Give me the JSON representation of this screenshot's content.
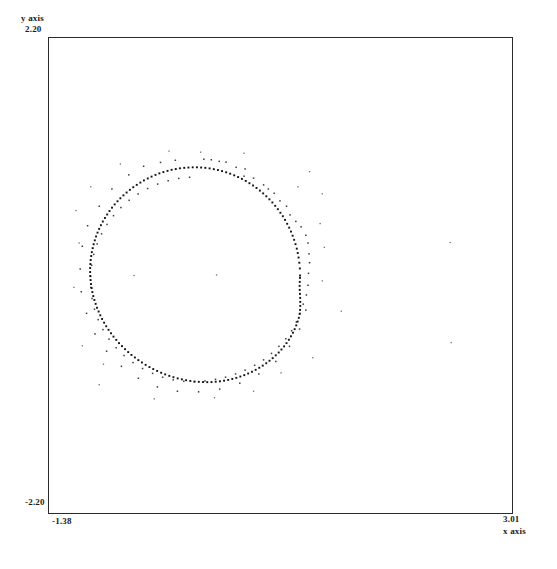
{
  "axes": {
    "y_title": "y axis",
    "y_max_label": "2.20",
    "y_min_label": "-2.20",
    "x_title": "x axis",
    "x_min_label": "-1.38",
    "x_max_label": "3.01"
  },
  "style": {
    "frame_color": "#2b2b2b",
    "point_color": "#111111",
    "background": "#ffffff"
  },
  "chart_data": {
    "type": "scatter",
    "title": "",
    "xlabel": "x axis",
    "ylabel": "y axis",
    "xlim": [
      -1.38,
      3.01
    ],
    "ylim": [
      -2.2,
      2.2
    ],
    "grid": false,
    "legend": null,
    "series": [
      {
        "name": "ring",
        "marker": "dot",
        "points": [
          [
            1.0,
            0.0
          ],
          [
            0.998,
            0.065
          ],
          [
            0.993,
            0.118
          ],
          [
            0.986,
            0.166
          ],
          [
            0.978,
            0.208
          ],
          [
            0.969,
            0.248
          ],
          [
            0.957,
            0.29
          ],
          [
            0.944,
            0.33
          ],
          [
            0.93,
            0.368
          ],
          [
            0.914,
            0.406
          ],
          [
            0.897,
            0.442
          ],
          [
            0.878,
            0.478
          ],
          [
            0.858,
            0.514
          ],
          [
            0.837,
            0.548
          ],
          [
            0.814,
            0.58
          ],
          [
            0.79,
            0.613
          ],
          [
            0.765,
            0.644
          ],
          [
            0.738,
            0.675
          ],
          [
            0.71,
            0.704
          ],
          [
            0.681,
            0.732
          ],
          [
            0.651,
            0.759
          ],
          [
            0.62,
            0.785
          ],
          [
            0.588,
            0.809
          ],
          [
            0.555,
            0.832
          ],
          [
            0.521,
            0.853
          ],
          [
            0.486,
            0.874
          ],
          [
            0.45,
            0.893
          ],
          [
            0.414,
            0.91
          ],
          [
            0.377,
            0.926
          ],
          [
            0.339,
            0.941
          ],
          [
            0.301,
            0.954
          ],
          [
            0.262,
            0.965
          ],
          [
            0.223,
            0.975
          ],
          [
            0.184,
            0.983
          ],
          [
            0.144,
            0.99
          ],
          [
            0.104,
            0.995
          ],
          [
            0.064,
            0.998
          ],
          [
            0.024,
            1.0
          ],
          [
            -0.016,
            1.0
          ],
          [
            -0.056,
            0.998
          ],
          [
            -0.096,
            0.995
          ],
          [
            -0.136,
            0.991
          ],
          [
            -0.176,
            0.984
          ],
          [
            -0.215,
            0.977
          ],
          [
            -0.254,
            0.967
          ],
          [
            -0.293,
            0.956
          ],
          [
            -0.331,
            0.944
          ],
          [
            -0.368,
            0.93
          ],
          [
            -0.405,
            0.914
          ],
          [
            -0.441,
            0.897
          ],
          [
            -0.477,
            0.879
          ],
          [
            -0.511,
            0.859
          ],
          [
            -0.545,
            0.838
          ],
          [
            -0.578,
            0.816
          ],
          [
            -0.61,
            0.792
          ],
          [
            -0.641,
            0.767
          ],
          [
            -0.671,
            0.741
          ],
          [
            -0.7,
            0.714
          ],
          [
            -0.727,
            0.686
          ],
          [
            -0.754,
            0.657
          ],
          [
            -0.779,
            0.627
          ],
          [
            -0.803,
            0.596
          ],
          [
            -0.825,
            0.564
          ],
          [
            -0.846,
            0.532
          ],
          [
            -0.866,
            0.499
          ],
          [
            -0.884,
            0.465
          ],
          [
            -0.901,
            0.431
          ],
          [
            -0.916,
            0.396
          ],
          [
            -0.93,
            0.361
          ],
          [
            -0.942,
            0.325
          ],
          [
            -0.953,
            0.289
          ],
          [
            -0.962,
            0.253
          ],
          [
            -0.97,
            0.216
          ],
          [
            -0.976,
            0.18
          ],
          [
            -0.981,
            0.143
          ],
          [
            -0.984,
            0.106
          ],
          [
            -0.986,
            0.069
          ],
          [
            -0.986,
            0.032
          ],
          [
            -0.985,
            -0.005
          ],
          [
            -0.982,
            -0.042
          ],
          [
            -0.978,
            -0.079
          ],
          [
            -0.972,
            -0.116
          ],
          [
            -0.965,
            -0.153
          ],
          [
            -0.956,
            -0.19
          ],
          [
            -0.946,
            -0.226
          ],
          [
            -0.934,
            -0.262
          ],
          [
            -0.921,
            -0.298
          ],
          [
            -0.906,
            -0.333
          ],
          [
            -0.89,
            -0.368
          ],
          [
            -0.873,
            -0.402
          ],
          [
            -0.854,
            -0.436
          ],
          [
            -0.834,
            -0.469
          ],
          [
            -0.812,
            -0.502
          ],
          [
            -0.789,
            -0.534
          ],
          [
            -0.765,
            -0.565
          ],
          [
            -0.739,
            -0.595
          ],
          [
            -0.713,
            -0.625
          ],
          [
            -0.685,
            -0.653
          ],
          [
            -0.656,
            -0.681
          ],
          [
            -0.626,
            -0.708
          ],
          [
            -0.595,
            -0.734
          ],
          [
            -0.563,
            -0.758
          ],
          [
            -0.53,
            -0.782
          ],
          [
            -0.496,
            -0.804
          ],
          [
            -0.461,
            -0.826
          ],
          [
            -0.425,
            -0.846
          ],
          [
            -0.389,
            -0.865
          ],
          [
            -0.352,
            -0.882
          ],
          [
            -0.314,
            -0.899
          ],
          [
            -0.276,
            -0.914
          ],
          [
            -0.237,
            -0.928
          ],
          [
            -0.198,
            -0.94
          ],
          [
            -0.158,
            -0.951
          ],
          [
            -0.118,
            -0.96
          ],
          [
            -0.078,
            -0.968
          ],
          [
            -0.038,
            -0.975
          ],
          [
            0.002,
            -0.98
          ],
          [
            0.042,
            -0.983
          ],
          [
            0.082,
            -0.985
          ],
          [
            0.122,
            -0.986
          ],
          [
            0.162,
            -0.985
          ],
          [
            0.202,
            -0.982
          ],
          [
            0.242,
            -0.978
          ],
          [
            0.281,
            -0.972
          ],
          [
            0.32,
            -0.965
          ],
          [
            0.359,
            -0.956
          ],
          [
            0.397,
            -0.946
          ],
          [
            0.435,
            -0.934
          ],
          [
            0.472,
            -0.921
          ],
          [
            0.509,
            -0.906
          ],
          [
            0.545,
            -0.89
          ],
          [
            0.58,
            -0.872
          ],
          [
            0.614,
            -0.853
          ],
          [
            0.647,
            -0.833
          ],
          [
            0.68,
            -0.811
          ],
          [
            0.711,
            -0.788
          ],
          [
            0.741,
            -0.764
          ],
          [
            0.77,
            -0.738
          ],
          [
            0.798,
            -0.712
          ],
          [
            0.824,
            -0.684
          ],
          [
            0.849,
            -0.655
          ],
          [
            0.872,
            -0.625
          ],
          [
            0.894,
            -0.594
          ],
          [
            0.914,
            -0.562
          ],
          [
            0.933,
            -0.529
          ],
          [
            0.949,
            -0.496
          ],
          [
            0.964,
            -0.461
          ],
          [
            0.977,
            -0.426
          ],
          [
            0.988,
            -0.391
          ],
          [
            0.996,
            -0.355
          ],
          [
            1.0,
            -0.318
          ],
          [
            1.002,
            -0.281
          ],
          [
            1.002,
            -0.244
          ],
          [
            1.001,
            -0.207
          ],
          [
            0.999,
            -0.17
          ],
          [
            0.997,
            -0.133
          ],
          [
            0.996,
            -0.096
          ],
          [
            0.997,
            -0.059
          ],
          [
            0.999,
            -0.022
          ]
        ]
      },
      {
        "name": "noise",
        "marker": "dot",
        "points": [
          [
            0.09,
            1.075
          ],
          [
            0.16,
            1.07
          ],
          [
            0.235,
            1.055
          ],
          [
            0.3,
            1.048
          ],
          [
            0.395,
            1.0
          ],
          [
            0.48,
            0.985
          ],
          [
            0.47,
            0.918
          ],
          [
            0.56,
            0.9
          ],
          [
            0.655,
            0.838
          ],
          [
            0.7,
            0.8
          ],
          [
            0.755,
            0.76
          ],
          [
            0.81,
            0.69
          ],
          [
            0.872,
            0.64
          ],
          [
            0.905,
            0.56
          ],
          [
            0.96,
            0.5
          ],
          [
            1.01,
            0.45
          ],
          [
            1.055,
            0.372
          ],
          [
            1.075,
            0.3
          ],
          [
            1.085,
            0.2
          ],
          [
            1.09,
            0.118
          ],
          [
            1.08,
            0.02
          ],
          [
            1.075,
            -0.09
          ],
          [
            1.06,
            -0.18
          ],
          [
            1.03,
            -0.265
          ],
          [
            1.0,
            -0.35
          ],
          [
            0.965,
            -0.43
          ],
          [
            0.92,
            -0.51
          ],
          [
            0.865,
            -0.585
          ],
          [
            0.8,
            -0.655
          ],
          [
            0.73,
            -0.72
          ],
          [
            0.655,
            -0.78
          ],
          [
            0.57,
            -0.83
          ],
          [
            0.48,
            -0.875
          ],
          [
            0.39,
            -0.91
          ],
          [
            0.295,
            -0.94
          ],
          [
            0.2,
            -0.96
          ],
          [
            0.1,
            -0.975
          ],
          [
            0.0,
            -0.982
          ],
          [
            -0.1,
            -0.978
          ],
          [
            -0.2,
            -0.965
          ],
          [
            -0.3,
            -0.94
          ],
          [
            -0.395,
            -0.905
          ],
          [
            -0.49,
            -0.86
          ],
          [
            -0.58,
            -0.805
          ],
          [
            -0.665,
            -0.74
          ],
          [
            -0.74,
            -0.668
          ],
          [
            -0.808,
            -0.588
          ],
          [
            -0.865,
            -0.5
          ],
          [
            -0.91,
            -0.408
          ],
          [
            -0.945,
            -0.312
          ],
          [
            -0.968,
            -0.212
          ],
          [
            -0.98,
            -0.11
          ],
          [
            -0.982,
            -0.008
          ],
          [
            -0.972,
            0.095
          ],
          [
            -0.952,
            0.195
          ],
          [
            -0.92,
            0.292
          ],
          [
            -0.878,
            0.385
          ],
          [
            -0.826,
            0.472
          ],
          [
            -0.765,
            0.553
          ],
          [
            -0.695,
            0.628
          ],
          [
            -0.617,
            0.695
          ],
          [
            -0.532,
            0.754
          ],
          [
            -0.442,
            0.804
          ],
          [
            -0.347,
            0.845
          ],
          [
            -0.248,
            0.876
          ],
          [
            -0.148,
            0.897
          ],
          [
            -0.045,
            0.908
          ],
          [
            -0.48,
            1.01
          ],
          [
            -0.32,
            1.045
          ],
          [
            -0.18,
            1.065
          ],
          [
            -0.62,
            0.93
          ],
          [
            -0.78,
            0.8
          ],
          [
            -0.9,
            0.64
          ],
          [
            -1.01,
            0.46
          ],
          [
            -1.06,
            0.27
          ],
          [
            -1.08,
            0.06
          ],
          [
            -1.07,
            -0.15
          ],
          [
            -1.02,
            -0.35
          ],
          [
            -0.94,
            -0.54
          ],
          [
            -0.83,
            -0.7
          ],
          [
            -0.69,
            -0.84
          ],
          [
            -0.53,
            -0.95
          ],
          [
            -0.35,
            -1.03
          ],
          [
            -0.16,
            -1.07
          ],
          [
            0.04,
            -1.075
          ],
          [
            0.24,
            -1.05
          ],
          [
            0.43,
            -0.995
          ],
          [
            0.61,
            -0.91
          ],
          [
            0.77,
            -0.795
          ],
          [
            0.9,
            -0.655
          ],
          [
            0.995,
            -0.495
          ],
          [
            1.055,
            -0.32
          ]
        ]
      },
      {
        "name": "outliers",
        "marker": "dot",
        "points": [
          [
            -0.57,
            0.0
          ],
          [
            0.21,
            0.005
          ],
          [
            2.42,
            0.305
          ],
          [
            2.43,
            -0.62
          ],
          [
            1.39,
            -0.33
          ],
          [
            1.23,
            0.26
          ],
          [
            1.21,
            0.755
          ],
          [
            1.09,
            0.96
          ],
          [
            0.47,
            1.13
          ],
          [
            -1.09,
            0.3
          ],
          [
            -1.14,
            -0.11
          ],
          [
            -1.06,
            -0.65
          ],
          [
            -0.9,
            -1.01
          ],
          [
            -0.38,
            -1.14
          ],
          [
            0.19,
            -1.13
          ],
          [
            0.56,
            -1.07
          ],
          [
            0.82,
            -0.9
          ],
          [
            1.12,
            -0.76
          ],
          [
            -0.24,
            1.15
          ],
          [
            0.06,
            1.14
          ],
          [
            -0.7,
            1.03
          ],
          [
            1.19,
            0.48
          ],
          [
            1.21,
            -0.05
          ],
          [
            -1.12,
            0.6
          ],
          [
            -0.98,
            0.82
          ],
          [
            -0.86,
            -0.82
          ],
          [
            0.98,
            0.82
          ]
        ]
      }
    ]
  }
}
